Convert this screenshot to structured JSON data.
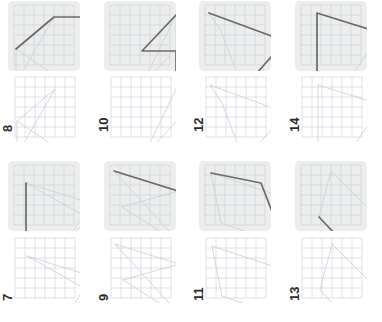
{
  "figure": {
    "title": "",
    "type": "polyline-shape-grid",
    "columns": 4,
    "rows": 2,
    "grid_cells": 6,
    "colors": {
      "background": "#ffffff",
      "card_background": "#eceded",
      "grid_line": "#c9cdd6",
      "highlight_stroke": "#6b6b6b",
      "faint_stroke": "#cfd2d6",
      "label_text": "#2b2b2b"
    }
  },
  "panels": [
    {
      "id": "panel-8",
      "label": "8",
      "row": 0,
      "col": 0,
      "faint_shape": [
        [
          8,
          48
        ],
        [
          8,
          82
        ],
        [
          46,
          16
        ],
        [
          8,
          48
        ],
        [
          70,
          90
        ]
      ],
      "highlight_shape": [
        [
          8,
          48
        ],
        [
          46,
          16
        ],
        [
          88,
          16
        ]
      ]
    },
    {
      "id": "panel-10",
      "label": "10",
      "row": 0,
      "col": 1,
      "faint_shape": [
        [
          38,
          84
        ],
        [
          72,
          48
        ],
        [
          72,
          14
        ],
        [
          38,
          84
        ],
        [
          18,
          92
        ]
      ],
      "highlight_shape": [
        [
          72,
          14
        ],
        [
          38,
          50
        ],
        [
          72,
          50
        ],
        [
          72,
          84
        ],
        [
          26,
          92
        ]
      ]
    },
    {
      "id": "panel-12",
      "label": "12",
      "row": 0,
      "col": 2,
      "faint_shape": [
        [
          10,
          12
        ],
        [
          86,
          40
        ],
        [
          44,
          88
        ],
        [
          22,
          30
        ],
        [
          10,
          12
        ]
      ],
      "highlight_shape": [
        [
          10,
          12
        ],
        [
          86,
          40
        ],
        [
          44,
          88
        ]
      ]
    },
    {
      "id": "panel-14",
      "label": "14",
      "row": 0,
      "col": 3,
      "faint_shape": [
        [
          22,
          12
        ],
        [
          86,
          32
        ],
        [
          46,
          90
        ],
        [
          22,
          90
        ],
        [
          22,
          12
        ]
      ],
      "highlight_shape": [
        [
          22,
          90
        ],
        [
          22,
          12
        ],
        [
          86,
          32
        ]
      ]
    },
    {
      "id": "panel-7",
      "label": "7",
      "row": 1,
      "col": 0,
      "faint_shape": [
        [
          18,
          22
        ],
        [
          82,
          42
        ],
        [
          62,
          76
        ],
        [
          82,
          58
        ],
        [
          18,
          22
        ]
      ],
      "highlight_shape": [
        [
          18,
          22
        ],
        [
          18,
          76
        ],
        [
          70,
          76
        ],
        [
          82,
          58
        ]
      ]
    },
    {
      "id": "panel-9",
      "label": "9",
      "row": 1,
      "col": 1,
      "faint_shape": [
        [
          10,
          10
        ],
        [
          74,
          30
        ],
        [
          18,
          46
        ],
        [
          78,
          84
        ],
        [
          10,
          10
        ]
      ],
      "highlight_shape": [
        [
          10,
          10
        ],
        [
          74,
          30
        ],
        [
          78,
          80
        ],
        [
          10,
          80
        ]
      ]
    },
    {
      "id": "panel-11",
      "label": "11",
      "row": 1,
      "col": 2,
      "faint_shape": [
        [
          12,
          12
        ],
        [
          78,
          34
        ],
        [
          86,
          84
        ],
        [
          22,
          62
        ],
        [
          12,
          12
        ]
      ],
      "highlight_shape": [
        [
          12,
          12
        ],
        [
          62,
          22
        ],
        [
          86,
          84
        ]
      ]
    },
    {
      "id": "panel-13",
      "label": "13",
      "row": 1,
      "col": 3,
      "faint_shape": [
        [
          36,
          10
        ],
        [
          84,
          58
        ],
        [
          56,
          90
        ],
        [
          24,
          56
        ],
        [
          36,
          10
        ]
      ],
      "highlight_shape": [
        [
          24,
          56
        ],
        [
          56,
          90
        ],
        [
          84,
          58
        ]
      ]
    }
  ]
}
